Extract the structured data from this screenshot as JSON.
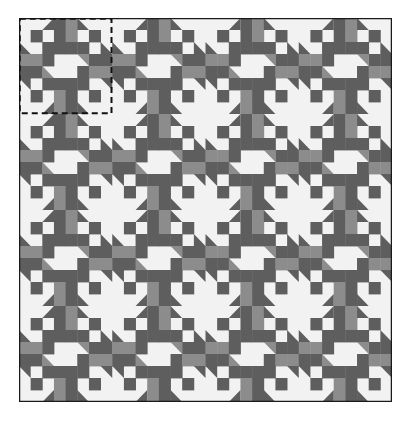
{
  "canvas": {
    "width": 407,
    "height": 422
  },
  "quilt": {
    "x": 19,
    "y": 18,
    "width": 373,
    "height": 384,
    "block_size": 93.5,
    "grid_units": 8,
    "rows": 4,
    "cols": 4,
    "border_color": "#1a1a1a",
    "colors": {
      "light": "#f2f2f2",
      "mid": "#8c8c8c",
      "dark": "#5e5e5e",
      "darker": "#6b6b6b"
    },
    "highlighted_block": {
      "row": 0,
      "col": 0,
      "style": "dashed"
    },
    "block_cells": [
      [
        "L",
        "L",
        "TDr",
        "D",
        "M",
        "TDl",
        "L",
        "L"
      ],
      [
        "L",
        "D",
        "L",
        "D",
        "M",
        "L",
        "D",
        "L"
      ],
      [
        "TDb",
        "L",
        "D",
        "D",
        "D",
        "D",
        "L",
        "TDb"
      ],
      [
        "M",
        "M",
        "D",
        "L",
        "L",
        "TMt",
        "D",
        "D"
      ],
      [
        "D",
        "D",
        "TMb",
        "L",
        "L",
        "D",
        "M",
        "M"
      ],
      [
        "TDt",
        "L",
        "D",
        "D",
        "D",
        "D",
        "L",
        "TDt"
      ],
      [
        "L",
        "D",
        "L",
        "M",
        "D",
        "L",
        "D",
        "L"
      ],
      [
        "L",
        "L",
        "TDr",
        "M",
        "D",
        "TDl",
        "L",
        "L"
      ]
    ]
  }
}
